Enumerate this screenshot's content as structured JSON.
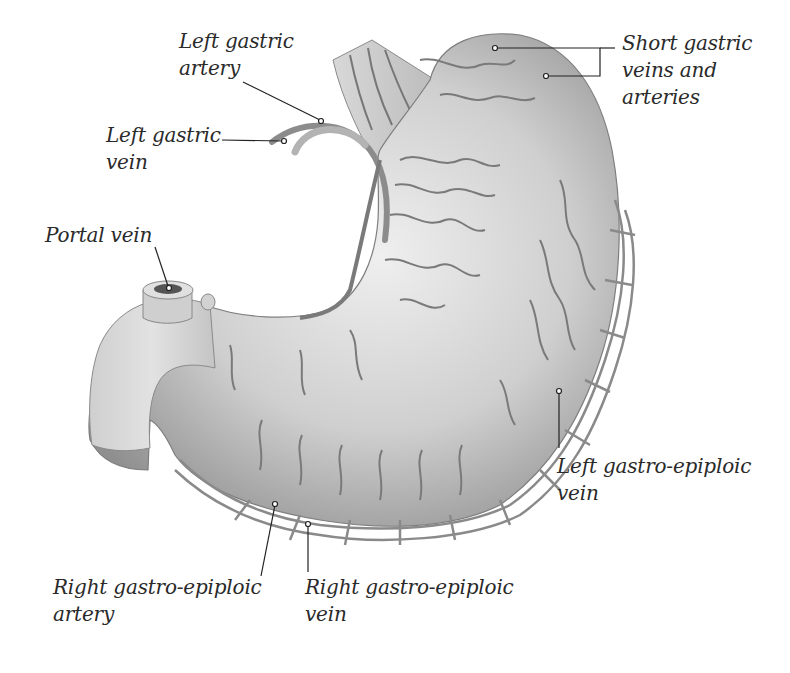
{
  "colors": {
    "background": "#ffffff",
    "organ_light": "#e6e6e6",
    "organ_mid": "#b9b9b9",
    "organ_dark": "#8a8a8a",
    "vessel": "#6e6e6e",
    "leader_line": "#222222",
    "text": "#2a2a2a"
  },
  "labels": {
    "left_gastric_artery": {
      "line1": "Left gastric",
      "line2": "artery"
    },
    "left_gastric_vein": {
      "line1": "Left gastric",
      "line2": "vein"
    },
    "portal_vein": {
      "line1": "Portal vein"
    },
    "short_gastric": {
      "line1": "Short gastric",
      "line2": "veins and",
      "line3": "arteries"
    },
    "left_gastro_epiploic_vein": {
      "line1": "Left gastro-epiploic",
      "line2": "vein"
    },
    "right_gastro_epiploic_artery": {
      "line1": "Right gastro-epiploic",
      "line2": "artery"
    },
    "right_gastro_epiploic_vein": {
      "line1": "Right gastro-epiploic",
      "line2": "vein"
    }
  }
}
